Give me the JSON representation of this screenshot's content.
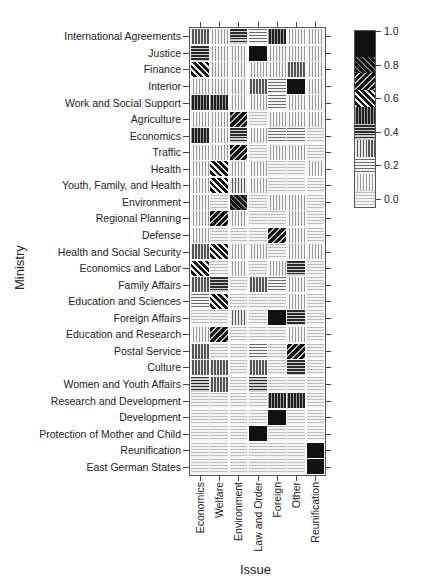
{
  "chart_data": {
    "type": "heatmap",
    "title": "",
    "xlabel": "Issue",
    "ylabel": "Ministry",
    "columns": [
      "Economics",
      "Welfare",
      "Environment",
      "Law and Order",
      "Foreign",
      "Other",
      "Reunification"
    ],
    "rows": [
      "International Agreements",
      "Justice",
      "Finance",
      "Interior",
      "Work and  Social Support",
      "Agriculture",
      "Economics",
      "Traffic",
      "Health",
      "Youth, Family, and Health",
      "Environment",
      "Regional Planning",
      "Defense",
      "Health and Social Security",
      "Economics and Labor",
      "Family Affairs",
      "Education and Sciences",
      "Foreign Affairs",
      "Education and Research",
      "Postal Service",
      "Culture",
      "Women and Youth Affairs",
      "Research and Development",
      "Development",
      "Protection of Mother and Child",
      "Reunification",
      "East German States"
    ],
    "values": [
      [
        0.35,
        0.15,
        0.45,
        0.25,
        0.55,
        0.15,
        0.15
      ],
      [
        0.45,
        0.15,
        0.15,
        0.95,
        0.15,
        0.15,
        0.15
      ],
      [
        0.65,
        0.15,
        0.15,
        0.15,
        0.15,
        0.35,
        0.15
      ],
      [
        0.15,
        0.15,
        0.15,
        0.35,
        0.25,
        0.95,
        0.15
      ],
      [
        0.55,
        0.55,
        0.15,
        0.15,
        0.25,
        0.15,
        0.15
      ],
      [
        0.15,
        0.15,
        0.75,
        0.05,
        0.15,
        0.15,
        0.15
      ],
      [
        0.55,
        0.15,
        0.45,
        0.15,
        0.25,
        0.25,
        0.05
      ],
      [
        0.15,
        0.15,
        0.75,
        0.05,
        0.15,
        0.15,
        0.05
      ],
      [
        0.15,
        0.65,
        0.15,
        0.15,
        0.05,
        0.05,
        0.15
      ],
      [
        0.15,
        0.65,
        0.35,
        0.15,
        0.05,
        0.05,
        0.05
      ],
      [
        0.15,
        0.05,
        0.85,
        0.05,
        0.15,
        0.15,
        0.05
      ],
      [
        0.15,
        0.75,
        0.15,
        0.05,
        0.05,
        0.15,
        0.05
      ],
      [
        0.15,
        0.05,
        0.05,
        0.05,
        0.75,
        0.15,
        0.05
      ],
      [
        0.35,
        0.65,
        0.15,
        0.15,
        0.05,
        0.15,
        0.15
      ],
      [
        0.65,
        0.05,
        0.15,
        0.05,
        0.15,
        0.45,
        0.05
      ],
      [
        0.35,
        0.45,
        0.05,
        0.35,
        0.25,
        0.15,
        0.05
      ],
      [
        0.25,
        0.65,
        0.05,
        0.05,
        0.05,
        0.15,
        0.05
      ],
      [
        0.05,
        0.05,
        0.35,
        0.05,
        0.95,
        0.45,
        0.05
      ],
      [
        0.15,
        0.75,
        0.05,
        0.05,
        0.05,
        0.15,
        0.05
      ],
      [
        0.35,
        0.05,
        0.05,
        0.25,
        0.05,
        0.75,
        0.05
      ],
      [
        0.35,
        0.35,
        0.05,
        0.35,
        0.05,
        0.45,
        0.05
      ],
      [
        0.45,
        0.35,
        0.05,
        0.45,
        0.05,
        0.05,
        0.05
      ],
      [
        0.05,
        0.05,
        0.05,
        0.05,
        0.55,
        0.55,
        0.05
      ],
      [
        0.05,
        0.05,
        0.05,
        0.05,
        0.95,
        0.05,
        0.05
      ],
      [
        0.05,
        0.05,
        0.05,
        0.95,
        0.05,
        0.05,
        0.05
      ],
      [
        0.05,
        0.05,
        0.05,
        0.05,
        0.05,
        0.05,
        0.95
      ],
      [
        0.05,
        0.05,
        0.05,
        0.05,
        0.05,
        0.05,
        0.95
      ]
    ],
    "colorbar": {
      "ticks": [
        "1.0",
        "0.8",
        "0.6",
        "0.4",
        "0.2",
        "0.0"
      ],
      "range": [
        0,
        1.05
      ]
    },
    "grid": false,
    "legend_position": "right"
  }
}
